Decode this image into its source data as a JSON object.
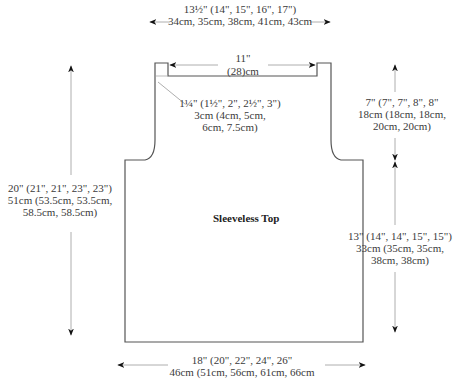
{
  "diagram": {
    "title": "Sleeveless Top",
    "colors": {
      "outline": "#555555",
      "arrow": "#999999",
      "arrowhead": "#111111",
      "text": "#3a3a3a"
    },
    "measurements": {
      "shoulder_width": {
        "line1": "13½\" (14\", 15\", 16\", 17\")",
        "line2": "34cm, 35cm, 38cm, 41cm, 43cm"
      },
      "neck_width": {
        "line1": "11\"",
        "line2": "(28)cm"
      },
      "neck_depth": {
        "line1": "1¼\" (1½\", 2\", 2½\", 3\")",
        "line2": "3cm (4cm, 5cm,",
        "line3": "6cm, 7.5cm)"
      },
      "armhole_depth": {
        "line1": "7\" (7\", 7\", 8\", 8\"",
        "line2": "18cm (18cm, 18cm,",
        "line3": "20cm, 20cm)"
      },
      "total_length": {
        "line1": "20\" (21\", 21\", 23\", 23\")",
        "line2": "51cm (53.5cm, 53.5cm,",
        "line3": "58.5cm, 58.5cm)"
      },
      "side_length": {
        "line1": "13\" (14\", 14\", 15\", 15\")",
        "line2": "33cm (35cm, 35cm,",
        "line3": "38cm, 38cm)"
      },
      "bottom_width": {
        "line1": "18\" (20\", 22\", 24\", 26\"",
        "line2": "46cm (51cm, 56cm, 61cm, 66cm"
      }
    }
  }
}
